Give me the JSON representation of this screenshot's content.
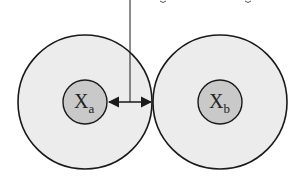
{
  "diagram": {
    "type": "two-touching-spheres",
    "colors": {
      "outer_fill": "#ececec",
      "inner_fill": "#c9c9c9",
      "stroke": "#1a1a1a",
      "background": "#ffffff"
    },
    "left": {
      "center_label": "X",
      "subscript": "a"
    },
    "right": {
      "center_label": "X",
      "subscript": "b"
    },
    "annotation": {
      "description": "double-headed arrow from inner circle edge to contact point, with leader line to truncated caption above"
    }
  }
}
